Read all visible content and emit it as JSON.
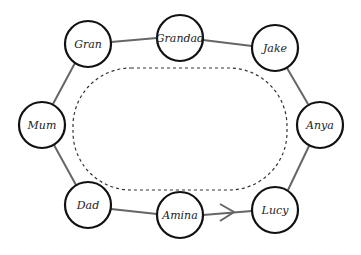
{
  "diagram": {
    "type": "circular-relationship-diagram",
    "nodes": [
      {
        "id": "gran",
        "label": "Gran",
        "cx": 88,
        "cy": 44
      },
      {
        "id": "grandad",
        "label": "Grandad",
        "cx": 180,
        "cy": 38
      },
      {
        "id": "jake",
        "label": "Jake",
        "cx": 275,
        "cy": 48
      },
      {
        "id": "anya",
        "label": "Anya",
        "cx": 320,
        "cy": 125
      },
      {
        "id": "lucy",
        "label": "Lucy",
        "cx": 275,
        "cy": 210
      },
      {
        "id": "amina",
        "label": "Amina",
        "cx": 180,
        "cy": 215
      },
      {
        "id": "dad",
        "label": "Dad",
        "cx": 88,
        "cy": 205
      },
      {
        "id": "mum",
        "label": "Mum",
        "cx": 42,
        "cy": 125
      }
    ],
    "edges": [
      {
        "from": "gran",
        "to": "grandad"
      },
      {
        "from": "grandad",
        "to": "jake"
      },
      {
        "from": "jake",
        "to": "anya"
      },
      {
        "from": "anya",
        "to": "lucy"
      },
      {
        "from": "amina",
        "to": "lucy",
        "arrow": true
      },
      {
        "from": "dad",
        "to": "amina"
      },
      {
        "from": "mum",
        "to": "dad"
      },
      {
        "from": "gran",
        "to": "mum"
      }
    ],
    "inner_boundary": {
      "style": "dashed",
      "shape": "rounded-rectangle"
    },
    "colors": {
      "node_stroke": "#111111",
      "edge": "#666666",
      "dashed": "#333333"
    }
  }
}
